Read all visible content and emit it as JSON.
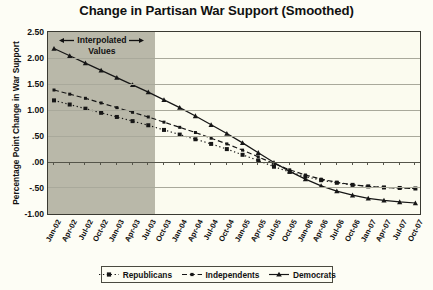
{
  "chart_data": {
    "type": "line",
    "title": "Change in Partisan War Support (Smoothed)",
    "xlabel": "",
    "ylabel": "Percentage Point Change in War Support",
    "ylim": [
      -1.0,
      2.5
    ],
    "ytick_step": 0.5,
    "ytick_labels": [
      "2.50",
      "2.00",
      "1.50",
      "1.00",
      ".50",
      ".00",
      "-.50",
      "-1.00"
    ],
    "ytick_values": [
      2.5,
      2.0,
      1.5,
      1.0,
      0.5,
      0.0,
      -0.5,
      -1.0
    ],
    "grid": true,
    "legend_position": "bottom",
    "categories": [
      "Jan-02",
      "Apr-02",
      "Jul-02",
      "Oct-02",
      "Jan-03",
      "Apr-03",
      "Jul-03",
      "Oct-03",
      "Jan-04",
      "Apr-04",
      "Jul-04",
      "Oct-04",
      "Jan-05",
      "Apr-05",
      "Jul-05",
      "Oct-05",
      "Jan-06",
      "Apr-06",
      "Jul-06",
      "Oct-06",
      "Jan-07",
      "Apr-07",
      "Jul-07",
      "Oct-07"
    ],
    "series": [
      {
        "name": "Republicans",
        "marker": "square",
        "line_style": "dotted",
        "color": "#161616",
        "values": [
          1.2,
          1.12,
          1.04,
          0.96,
          0.88,
          0.8,
          0.72,
          0.63,
          0.54,
          0.45,
          0.36,
          0.26,
          0.15,
          0.04,
          -0.08,
          -0.18,
          -0.27,
          -0.34,
          -0.39,
          -0.43,
          -0.46,
          -0.48,
          -0.49,
          -0.5
        ]
      },
      {
        "name": "Independents",
        "marker": "small-square",
        "line_style": "dashed",
        "color": "#161616",
        "values": [
          1.4,
          1.32,
          1.24,
          1.15,
          1.06,
          0.97,
          0.88,
          0.78,
          0.68,
          0.58,
          0.47,
          0.36,
          0.24,
          0.11,
          -0.02,
          -0.14,
          -0.24,
          -0.32,
          -0.38,
          -0.43,
          -0.46,
          -0.48,
          -0.49,
          -0.5
        ]
      },
      {
        "name": "Democrats",
        "marker": "triangle",
        "line_style": "solid",
        "color": "#161616",
        "values": [
          2.2,
          2.06,
          1.92,
          1.78,
          1.64,
          1.5,
          1.36,
          1.21,
          1.06,
          0.9,
          0.73,
          0.56,
          0.38,
          0.19,
          0.0,
          -0.17,
          -0.32,
          -0.45,
          -0.55,
          -0.63,
          -0.69,
          -0.73,
          -0.76,
          -0.78
        ]
      }
    ],
    "annotation": {
      "line1": "Interpolated",
      "line2": "Values",
      "shaded_from": "Jan-02",
      "shaded_to": "Jul-03",
      "shade_color": "#b9b8a9"
    }
  }
}
